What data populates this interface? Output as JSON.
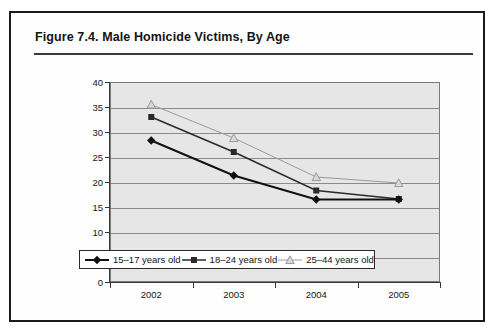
{
  "figure": {
    "title": "Figure 7.4.  Male Homicide Victims, By Age"
  },
  "legend": {
    "items": [
      {
        "label": "15–17 years old",
        "marker": "diamond-marker-icon",
        "color": "#111111"
      },
      {
        "label": "18–24 years old",
        "marker": "square-marker-icon",
        "color": "#2a2a2a"
      },
      {
        "label": "25–44 years old",
        "marker": "triangle-marker-icon",
        "color": "#9a9a9a"
      }
    ]
  },
  "axis": {
    "y_ticks": [
      "0",
      "5",
      "10",
      "15",
      "20",
      "25",
      "30",
      "35",
      "40"
    ],
    "x_ticks": [
      "2002",
      "2003",
      "2004",
      "2005"
    ]
  },
  "chart_data": {
    "type": "line",
    "title": "Figure 7.4.  Male Homicide Victims, By Age",
    "xlabel": "",
    "ylabel": "",
    "categories": [
      "2002",
      "2003",
      "2004",
      "2005"
    ],
    "series": [
      {
        "name": "15–17 years old",
        "values": [
          28.3,
          21.3,
          16.5,
          16.5
        ],
        "marker": "diamond",
        "color": "#111111"
      },
      {
        "name": "18–24 years old",
        "values": [
          33.0,
          26.0,
          18.3,
          16.6
        ],
        "marker": "square",
        "color": "#2a2a2a"
      },
      {
        "name": "25–44 years old",
        "values": [
          35.5,
          28.8,
          21.0,
          19.8
        ],
        "marker": "triangle",
        "color": "#9a9a9a"
      }
    ],
    "ylim": [
      0,
      40
    ],
    "ytick_step": 5,
    "grid": true,
    "legend_position": "bottom"
  }
}
